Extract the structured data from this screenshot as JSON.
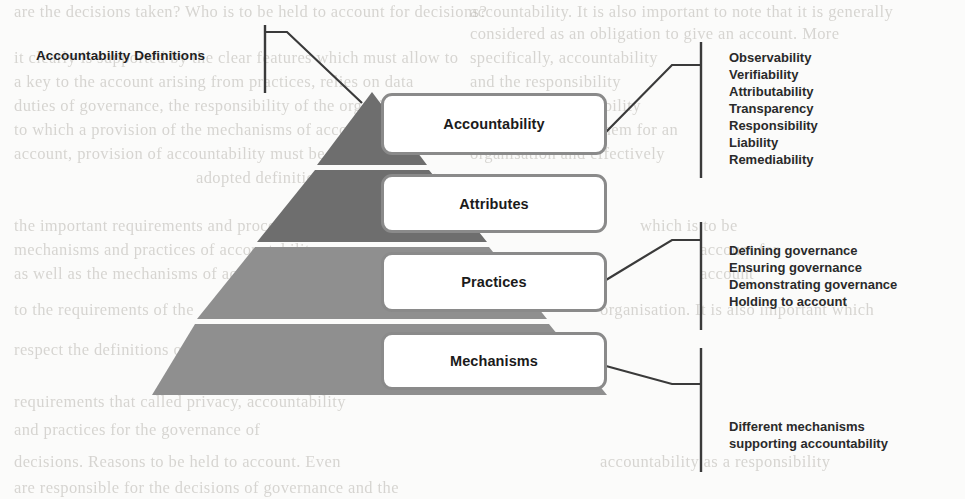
{
  "figure": {
    "left_label": "Accountability Definitions",
    "pyramid_levels": [
      {
        "label": "Accountability",
        "band_color": "#6e6e6e"
      },
      {
        "label": "Attributes",
        "band_color": "#6e6e6e"
      },
      {
        "label": "Practices",
        "band_color": "#8f8f8f"
      },
      {
        "label": "Mechanisms",
        "band_color": "#8f8f8f"
      }
    ],
    "annotations": [
      {
        "id": "attributes-annotation",
        "lines": [
          "Observability",
          "Verifiability",
          "Attributability",
          "Transparency",
          "Responsibility",
          "Liability",
          "Remediability"
        ]
      },
      {
        "id": "practices-annotation",
        "lines": [
          "Defining governance",
          "Ensuring governance",
          "Demonstrating governance",
          "Holding to account"
        ]
      },
      {
        "id": "mechanisms-annotation",
        "lines": [
          "Different mechanisms",
          "supporting accountability"
        ]
      }
    ],
    "colors": {
      "band_dark": "#6e6e6e",
      "band_light": "#8f8f8f",
      "box_border": "#8a8a8a",
      "box_fill": "#ffffff",
      "line": "#3a3a3a",
      "text": "#1f1f1f",
      "page_background": "#fbfbfa"
    }
  },
  "background_ghost_text": [
    {
      "text": "are the decisions taken? Who is to be held to account for decisions?",
      "x": 14,
      "y": 2
    },
    {
      "text": "accountability. It is also important to note that it is generally",
      "x": 470,
      "y": 2
    },
    {
      "text": "considered as an obligation to give an account. More",
      "x": 470,
      "y": 24
    },
    {
      "text": "it clearly is supported by the clear features which must allow to",
      "x": 14,
      "y": 48
    },
    {
      "text": "specifically, accountability",
      "x": 470,
      "y": 48
    },
    {
      "text": "a key to the account arising from practices, relies on data",
      "x": 14,
      "y": 72
    },
    {
      "text": "and the responsibility",
      "x": 470,
      "y": 72
    },
    {
      "text": "duties of governance, the responsibility of the organisation",
      "x": 14,
      "y": 96
    },
    {
      "text": "for which accountability",
      "x": 470,
      "y": 96
    },
    {
      "text": "to which a provision of the mechanisms of account for an",
      "x": 14,
      "y": 120
    },
    {
      "text": "it should be all of them for an",
      "x": 470,
      "y": 120
    },
    {
      "text": "account, provision of accountability must be shown for an",
      "x": 14,
      "y": 144
    },
    {
      "text": "organisation and effectively",
      "x": 470,
      "y": 144
    },
    {
      "text": "adopted definition of accountability",
      "x": 196,
      "y": 168
    },
    {
      "text": "the important requirements and process of governance",
      "x": 14,
      "y": 216
    },
    {
      "text": "which is to be",
      "x": 640,
      "y": 216
    },
    {
      "text": "mechanisms and practices of accountability",
      "x": 14,
      "y": 240
    },
    {
      "text": "account for",
      "x": 700,
      "y": 240
    },
    {
      "text": "as well as the mechanisms of accountability",
      "x": 14,
      "y": 264
    },
    {
      "text": "account",
      "x": 700,
      "y": 264
    },
    {
      "text": "to the requirements of the",
      "x": 14,
      "y": 300
    },
    {
      "text": "organisation. It is also important which",
      "x": 600,
      "y": 300
    },
    {
      "text": "respect the definitions of accountability the practices",
      "x": 14,
      "y": 340
    },
    {
      "text": "requirements that called privacy, accountability",
      "x": 14,
      "y": 392
    },
    {
      "text": "and practices for the governance of",
      "x": 14,
      "y": 420
    },
    {
      "text": "decisions. Reasons to be held to account. Even",
      "x": 14,
      "y": 452
    },
    {
      "text": "accountability as a responsibility",
      "x": 600,
      "y": 452
    },
    {
      "text": "are responsible for the decisions of governance and the",
      "x": 14,
      "y": 478
    }
  ]
}
